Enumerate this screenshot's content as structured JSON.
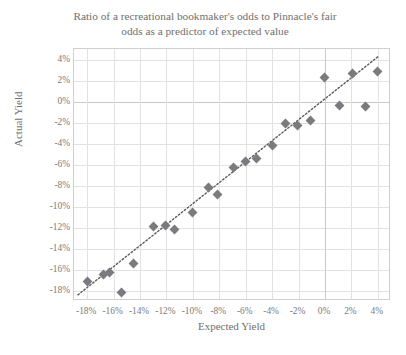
{
  "chart_data": {
    "type": "scatter",
    "title": "Ratio of a recreational bookmaker's odds to Pinnacle's fair\nodds as a predictor of expected value",
    "xlabel": "Expected Yield",
    "ylabel": "Actual Yield",
    "xlim": [
      -19,
      5
    ],
    "ylim": [
      -19,
      5
    ],
    "xticks": [
      "-18%",
      "-16%",
      "-14%",
      "-12%",
      "-10%",
      "-8%",
      "-6%",
      "-4%",
      "-2%",
      "0%",
      "2%",
      "4%"
    ],
    "xtick_values": [
      -18,
      -16,
      -14,
      -12,
      -10,
      -8,
      -6,
      -4,
      -2,
      0,
      2,
      4
    ],
    "yticks": [
      "4%",
      "2%",
      "0%",
      "-2%",
      "-4%",
      "-6%",
      "-8%",
      "-10%",
      "-12%",
      "-14%",
      "-16%",
      "-18%"
    ],
    "ytick_values": [
      4,
      2,
      0,
      -2,
      -4,
      -6,
      -8,
      -10,
      -12,
      -14,
      -16,
      -18
    ],
    "grid": true,
    "legend": false,
    "marker_color": "#7a7a80",
    "marker_shape": "diamond",
    "trendline": {
      "visible": true,
      "style": "dotted",
      "color": "#5a5a5a",
      "x_start": -18.7,
      "y_start": -18.6,
      "x_end": 4.2,
      "y_end": 4.3
    },
    "points": [
      {
        "x": -18.0,
        "y": -17.1
      },
      {
        "x": -16.8,
        "y": -16.5
      },
      {
        "x": -16.3,
        "y": -16.3
      },
      {
        "x": -15.4,
        "y": -18.2
      },
      {
        "x": -14.5,
        "y": -15.4
      },
      {
        "x": -13.0,
        "y": -11.9
      },
      {
        "x": -12.1,
        "y": -11.8
      },
      {
        "x": -11.4,
        "y": -12.2
      },
      {
        "x": -10.0,
        "y": -10.6
      },
      {
        "x": -8.8,
        "y": -8.2
      },
      {
        "x": -8.1,
        "y": -8.9
      },
      {
        "x": -6.9,
        "y": -6.3
      },
      {
        "x": -6.0,
        "y": -5.7
      },
      {
        "x": -5.2,
        "y": -5.4
      },
      {
        "x": -4.0,
        "y": -4.2
      },
      {
        "x": -3.0,
        "y": -2.1
      },
      {
        "x": -2.1,
        "y": -2.3
      },
      {
        "x": -1.1,
        "y": -1.8
      },
      {
        "x": 0.0,
        "y": 2.3
      },
      {
        "x": 1.1,
        "y": -0.4
      },
      {
        "x": 2.1,
        "y": 2.7
      },
      {
        "x": 3.1,
        "y": -0.5
      },
      {
        "x": 4.0,
        "y": 2.9
      }
    ]
  }
}
